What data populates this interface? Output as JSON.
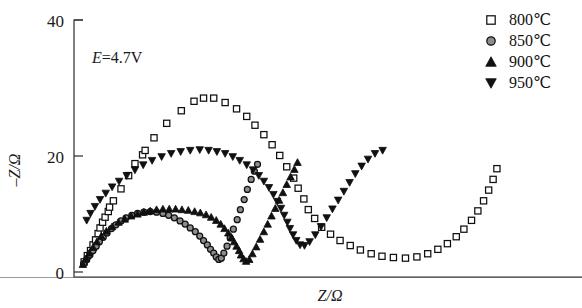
{
  "chart_data": {
    "type": "scatter",
    "title": "",
    "xlabel": "Z/Ω",
    "ylabel": "–Z/Ω",
    "xlim": [
      0,
      80
    ],
    "ylim": [
      0,
      40
    ],
    "yticks": [
      0,
      20,
      40
    ],
    "xticks": [],
    "grid": false,
    "legend_position": "right-top",
    "annotations": [
      {
        "text_italic": "E",
        "text_rest": "=4.7V",
        "x": 7,
        "y": 35
      }
    ],
    "series": [
      {
        "name": "800 ℃",
        "label": "800℃",
        "marker": "open-square",
        "color": "#101010",
        "fill": "#ffffff",
        "points": [
          [
            1.6,
            1.6
          ],
          [
            2.1,
            2.6
          ],
          [
            2.6,
            3.4
          ],
          [
            3.0,
            4.3
          ],
          [
            3.4,
            5.1
          ],
          [
            3.8,
            6.1
          ],
          [
            4.1,
            7.0
          ],
          [
            4.5,
            7.9
          ],
          [
            4.9,
            8.7
          ],
          [
            5.4,
            9.6
          ],
          [
            5.6,
            10.3
          ],
          [
            6.2,
            11.3
          ],
          [
            7.4,
            13.2
          ],
          [
            8.6,
            15.3
          ],
          [
            9.6,
            17.2
          ],
          [
            10.8,
            18.6
          ],
          [
            11.2,
            19.3
          ],
          [
            12.6,
            21.3
          ],
          [
            14.6,
            23.6
          ],
          [
            16.9,
            25.6
          ],
          [
            18.9,
            27.1
          ],
          [
            20.4,
            27.6
          ],
          [
            22.0,
            27.6
          ],
          [
            23.8,
            26.9
          ],
          [
            25.6,
            25.9
          ],
          [
            27.2,
            24.7
          ],
          [
            28.5,
            23.3
          ],
          [
            29.9,
            21.8
          ],
          [
            31.2,
            20.2
          ],
          [
            32.4,
            18.5
          ],
          [
            33.5,
            16.7
          ],
          [
            34.6,
            14.9
          ],
          [
            35.3,
            13.3
          ],
          [
            36.2,
            11.6
          ],
          [
            36.9,
            9.9
          ],
          [
            37.9,
            8.5
          ],
          [
            39.0,
            7.1
          ],
          [
            40.4,
            6.0
          ],
          [
            41.9,
            5.0
          ],
          [
            43.5,
            4.2
          ],
          [
            45.1,
            3.5
          ],
          [
            46.8,
            2.9
          ],
          [
            48.5,
            2.5
          ],
          [
            50.3,
            2.3
          ],
          [
            52.2,
            2.2
          ],
          [
            54.0,
            2.4
          ],
          [
            55.7,
            2.9
          ],
          [
            57.3,
            3.6
          ],
          [
            58.8,
            4.5
          ],
          [
            60.2,
            5.6
          ],
          [
            61.4,
            6.8
          ],
          [
            62.6,
            8.2
          ],
          [
            63.6,
            9.7
          ],
          [
            64.5,
            11.3
          ],
          [
            65.3,
            13.0
          ],
          [
            66.0,
            14.7
          ],
          [
            66.6,
            16.4
          ]
        ]
      },
      {
        "name": "850 ℃",
        "label": "850℃",
        "marker": "filled-circle-grey",
        "color": "#8d8d8d",
        "fill": "#8d8d8d",
        "points": [
          [
            1.5,
            1.3
          ],
          [
            2.0,
            2.0
          ],
          [
            2.5,
            2.7
          ],
          [
            3.0,
            3.4
          ],
          [
            3.5,
            4.1
          ],
          [
            4.0,
            4.8
          ],
          [
            4.6,
            5.5
          ],
          [
            5.2,
            6.2
          ],
          [
            5.9,
            6.9
          ],
          [
            6.6,
            7.5
          ],
          [
            7.4,
            8.1
          ],
          [
            8.2,
            8.6
          ],
          [
            9.1,
            9.0
          ],
          [
            10.0,
            9.3
          ],
          [
            11.0,
            9.5
          ],
          [
            12.0,
            9.6
          ],
          [
            13.0,
            9.5
          ],
          [
            14.0,
            9.3
          ],
          [
            14.9,
            9.0
          ],
          [
            15.8,
            8.6
          ],
          [
            16.7,
            8.1
          ],
          [
            17.5,
            7.6
          ],
          [
            18.3,
            7.0
          ],
          [
            19.1,
            6.4
          ],
          [
            19.8,
            5.7
          ],
          [
            20.4,
            5.0
          ],
          [
            21.0,
            4.3
          ],
          [
            21.5,
            3.6
          ],
          [
            22.0,
            3.0
          ],
          [
            22.4,
            2.4
          ],
          [
            22.8,
            2.0
          ],
          [
            23.2,
            2.2
          ],
          [
            23.6,
            3.0
          ],
          [
            24.1,
            4.1
          ],
          [
            24.6,
            5.4
          ],
          [
            25.1,
            6.8
          ],
          [
            25.7,
            8.3
          ],
          [
            26.2,
            9.9
          ],
          [
            26.8,
            11.5
          ],
          [
            27.3,
            13.1
          ],
          [
            27.9,
            14.7
          ],
          [
            28.4,
            16.0
          ],
          [
            28.9,
            17.1
          ]
        ]
      },
      {
        "name": "900 ℃",
        "label": "900℃",
        "marker": "filled-triangle-up",
        "color": "#101010",
        "fill": "#101010",
        "points": [
          [
            1.4,
            1.2
          ],
          [
            1.9,
            2.1
          ],
          [
            2.4,
            3.0
          ],
          [
            3.0,
            3.9
          ],
          [
            3.6,
            4.8
          ],
          [
            4.3,
            5.7
          ],
          [
            5.1,
            6.5
          ],
          [
            6.0,
            7.2
          ],
          [
            7.0,
            7.9
          ],
          [
            8.0,
            8.4
          ],
          [
            9.0,
            8.9
          ],
          [
            10.0,
            9.2
          ],
          [
            11.0,
            9.5
          ],
          [
            12.0,
            9.7
          ],
          [
            13.0,
            9.9
          ],
          [
            14.0,
            10.0
          ],
          [
            15.0,
            10.0
          ],
          [
            16.0,
            10.0
          ],
          [
            17.0,
            9.9
          ],
          [
            18.0,
            9.8
          ],
          [
            19.0,
            9.6
          ],
          [
            19.9,
            9.4
          ],
          [
            20.8,
            9.1
          ],
          [
            21.6,
            8.7
          ],
          [
            22.4,
            8.2
          ],
          [
            23.1,
            7.6
          ],
          [
            23.7,
            6.9
          ],
          [
            24.3,
            6.2
          ],
          [
            24.8,
            5.5
          ],
          [
            25.2,
            4.8
          ],
          [
            25.6,
            4.1
          ],
          [
            26.0,
            3.4
          ],
          [
            26.3,
            2.7
          ],
          [
            26.7,
            2.1
          ],
          [
            27.1,
            1.7
          ],
          [
            27.6,
            2.0
          ],
          [
            28.1,
            2.9
          ],
          [
            28.7,
            4.0
          ],
          [
            29.3,
            5.2
          ],
          [
            29.9,
            6.4
          ],
          [
            30.5,
            7.6
          ],
          [
            31.1,
            8.9
          ],
          [
            31.7,
            10.1
          ],
          [
            32.3,
            11.4
          ],
          [
            32.9,
            12.6
          ],
          [
            33.5,
            13.9
          ],
          [
            34.1,
            15.1
          ],
          [
            34.7,
            16.3
          ],
          [
            35.2,
            17.4
          ]
        ]
      },
      {
        "name": "950 ℃",
        "label": "950℃",
        "marker": "filled-triangle-down",
        "color": "#101010",
        "fill": "#101010",
        "points": [
          [
            2.0,
            8.2
          ],
          [
            2.6,
            9.3
          ],
          [
            3.3,
            10.4
          ],
          [
            4.1,
            11.5
          ],
          [
            5.0,
            12.5
          ],
          [
            6.0,
            13.5
          ],
          [
            7.1,
            14.4
          ],
          [
            8.3,
            15.3
          ],
          [
            9.6,
            16.2
          ],
          [
            10.9,
            17.0
          ],
          [
            12.3,
            17.7
          ],
          [
            13.8,
            18.3
          ],
          [
            15.3,
            18.8
          ],
          [
            16.8,
            19.1
          ],
          [
            18.3,
            19.3
          ],
          [
            19.8,
            19.4
          ],
          [
            21.2,
            19.3
          ],
          [
            22.5,
            19.1
          ],
          [
            23.8,
            18.8
          ],
          [
            25.0,
            18.3
          ],
          [
            26.1,
            17.7
          ],
          [
            27.2,
            17.0
          ],
          [
            28.2,
            16.2
          ],
          [
            29.1,
            15.3
          ],
          [
            29.9,
            14.4
          ],
          [
            30.7,
            13.4
          ],
          [
            31.4,
            12.3
          ],
          [
            32.0,
            11.2
          ],
          [
            32.6,
            10.1
          ],
          [
            33.1,
            9.0
          ],
          [
            33.6,
            7.9
          ],
          [
            34.0,
            6.9
          ],
          [
            34.5,
            5.9
          ],
          [
            35.0,
            5.0
          ],
          [
            35.6,
            4.3
          ],
          [
            36.3,
            4.2
          ],
          [
            37.1,
            4.8
          ],
          [
            38.0,
            5.9
          ],
          [
            38.9,
            7.2
          ],
          [
            39.8,
            8.6
          ],
          [
            40.7,
            10.0
          ],
          [
            41.6,
            11.4
          ],
          [
            42.5,
            12.8
          ],
          [
            43.4,
            14.2
          ],
          [
            44.3,
            15.6
          ],
          [
            45.3,
            16.8
          ],
          [
            46.3,
            17.9
          ],
          [
            47.4,
            18.8
          ],
          [
            48.6,
            19.3
          ]
        ]
      }
    ]
  },
  "legend": {
    "items": [
      {
        "label": "800℃",
        "marker": "open-square"
      },
      {
        "label": "850℃",
        "marker": "filled-circle-grey"
      },
      {
        "label": "900℃",
        "marker": "filled-triangle-up"
      },
      {
        "label": "950℃",
        "marker": "filled-triangle-down"
      }
    ]
  },
  "axes": {
    "ytick_labels": [
      "40",
      "20",
      "0"
    ],
    "y_title": "–Z/Ω",
    "x_title": "Z/Ω"
  }
}
